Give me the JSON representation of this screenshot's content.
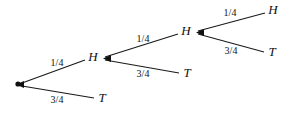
{
  "diagram": {
    "type": "probability-tree",
    "stroke_color": "#1a1a1a",
    "text_color": "#111111",
    "background_color": "#ffffff",
    "root": {
      "id": "root",
      "label": "",
      "x": 18,
      "y": 84,
      "marker": "dot"
    },
    "nodes": [
      {
        "id": "h1",
        "label": "H",
        "x": 93,
        "y": 58,
        "level": 1,
        "marker": "arrow-in"
      },
      {
        "id": "t1",
        "label": "T",
        "x": 102,
        "y": 99,
        "level": 1,
        "marker": "none"
      },
      {
        "id": "h2",
        "label": "H",
        "x": 186,
        "y": 32,
        "level": 2,
        "marker": "arrow-in"
      },
      {
        "id": "t2",
        "label": "T",
        "x": 187,
        "y": 74,
        "level": 2,
        "marker": "none"
      },
      {
        "id": "h3",
        "label": "H",
        "x": 273,
        "y": 11,
        "level": 3,
        "marker": "none"
      },
      {
        "id": "t3",
        "label": "T",
        "x": 272,
        "y": 53,
        "level": 3,
        "marker": "none"
      }
    ],
    "edges": [
      {
        "id": "e-root-h1",
        "from": "root",
        "to": "h1",
        "label": "1/4",
        "label_x": 57,
        "label_y": 64,
        "x1": 22,
        "y1": 83,
        "x2": 85,
        "y2": 60
      },
      {
        "id": "e-root-t1",
        "from": "root",
        "to": "t1",
        "label": "3/4",
        "label_x": 57,
        "label_y": 101,
        "x1": 22,
        "y1": 86,
        "x2": 94,
        "y2": 98
      },
      {
        "id": "e-h1-h2",
        "from": "h1",
        "to": "h2",
        "label": "1/4",
        "label_x": 143,
        "label_y": 40,
        "x1": 105,
        "y1": 57,
        "x2": 178,
        "y2": 34
      },
      {
        "id": "e-h1-t2",
        "from": "h1",
        "to": "t2",
        "label": "3/4",
        "label_x": 143,
        "label_y": 75,
        "x1": 105,
        "y1": 60,
        "x2": 179,
        "y2": 73
      },
      {
        "id": "e-h2-h3",
        "from": "h2",
        "to": "h3",
        "label": "1/4",
        "label_x": 230,
        "label_y": 14,
        "x1": 198,
        "y1": 31,
        "x2": 265,
        "y2": 13
      },
      {
        "id": "e-h2-t3",
        "from": "h2",
        "to": "t3",
        "label": "3/4",
        "label_x": 231,
        "label_y": 52,
        "x1": 198,
        "y1": 34,
        "x2": 264,
        "y2": 52
      }
    ]
  }
}
